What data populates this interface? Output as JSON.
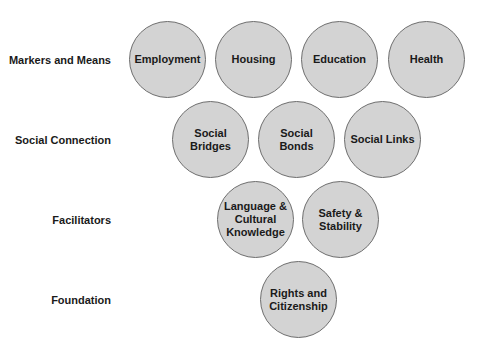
{
  "diagram": {
    "rows": [
      {
        "label": "Markers and Means",
        "nodes": [
          "Employment",
          "Housing",
          "Education",
          "Health"
        ]
      },
      {
        "label": "Social Connection",
        "nodes": [
          "Social\nBridges",
          "Social\nBonds",
          "Social Links"
        ]
      },
      {
        "label": "Facilitators",
        "nodes": [
          "Language &\nCultural\nKnowledge",
          "Safety &\nStability"
        ]
      },
      {
        "label": "Foundation",
        "nodes": [
          "Rights and\nCitizenship"
        ]
      }
    ],
    "colors": {
      "node_fill": "#d3d3d3",
      "node_stroke": "#6e6e6e",
      "text": "#1a1a1a",
      "background": "#ffffff"
    }
  }
}
